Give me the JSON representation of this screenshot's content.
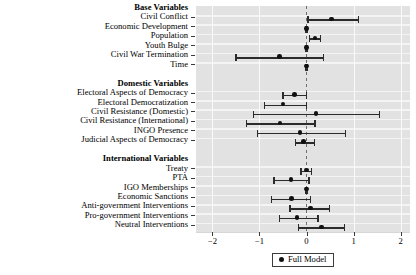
{
  "chart_data": {
    "type": "scatter",
    "plot_style": "coefficient-forest-plot",
    "title": "",
    "xlabel": "",
    "ylabel": "",
    "xlim": [
      -2.35,
      2.2
    ],
    "xticks": [
      -2,
      -1,
      0,
      1,
      2
    ],
    "xticklabels": [
      "−2",
      "−1",
      "0",
      "1",
      "2"
    ],
    "grid": true,
    "reference_line": 0,
    "legend": {
      "position": "bottom-center",
      "entries": [
        "Full Model"
      ]
    },
    "groups": [
      {
        "label": "Base Variables",
        "rows": [
          {
            "label": "Civil Conflict",
            "estimate": 0.53,
            "ci_low": 0.03,
            "ci_high": 1.11
          },
          {
            "label": "Economic Development",
            "estimate": 0.0,
            "ci_low": -0.01,
            "ci_high": 0.01
          },
          {
            "label": "Population",
            "estimate": 0.18,
            "ci_low": 0.06,
            "ci_high": 0.3
          },
          {
            "label": "Youth Bulge",
            "estimate": 0.0,
            "ci_low": -0.01,
            "ci_high": 0.01
          },
          {
            "label": "Civil War Termination",
            "estimate": -0.57,
            "ci_low": -1.5,
            "ci_high": 0.36
          },
          {
            "label": "Time",
            "estimate": 0.0,
            "ci_low": -0.01,
            "ci_high": 0.01
          }
        ]
      },
      {
        "label": "Domestic Variables",
        "rows": [
          {
            "label": "Electoral Aspects of Democracy",
            "estimate": -0.26,
            "ci_low": -0.5,
            "ci_high": 0.0
          },
          {
            "label": "Electoral Democratization",
            "estimate": -0.5,
            "ci_low": -0.9,
            "ci_high": 0.0
          },
          {
            "label": "Civil Resistance (Domestic)",
            "estimate": 0.2,
            "ci_low": -1.13,
            "ci_high": 1.55
          },
          {
            "label": "Civil Resistance (International)",
            "estimate": -0.56,
            "ci_low": -1.28,
            "ci_high": 0.18
          },
          {
            "label": "INGO Presence",
            "estimate": -0.14,
            "ci_low": -1.05,
            "ci_high": 0.83
          },
          {
            "label": "Judicial Aspects of Democracy",
            "estimate": -0.06,
            "ci_low": -0.24,
            "ci_high": 0.17
          }
        ]
      },
      {
        "label": "International Variables",
        "rows": [
          {
            "label": "Treaty",
            "estimate": 0.0,
            "ci_low": -0.12,
            "ci_high": 0.11
          },
          {
            "label": "PTA",
            "estimate": -0.33,
            "ci_low": -0.69,
            "ci_high": 0.05
          },
          {
            "label": "IGO Memberships",
            "estimate": 0.0,
            "ci_low": -0.01,
            "ci_high": 0.01
          },
          {
            "label": "Economic Sanctions",
            "estimate": -0.32,
            "ci_low": -0.75,
            "ci_high": 0.08
          },
          {
            "label": "Anti-government Interventions",
            "estimate": 0.08,
            "ci_low": -0.35,
            "ci_high": 0.49
          },
          {
            "label": "Pro-government Interventions",
            "estimate": -0.2,
            "ci_low": -0.57,
            "ci_high": 0.24
          },
          {
            "label": "Neutral Interventions",
            "estimate": 0.32,
            "ci_low": -0.17,
            "ci_high": 0.8
          }
        ]
      }
    ]
  },
  "colors": {
    "panel_background": "#e2e2e2",
    "grid_line": "#f4f4f4",
    "point": "#111111",
    "interval": "#2b2b2b",
    "reference_line": "#6e6e6e"
  }
}
